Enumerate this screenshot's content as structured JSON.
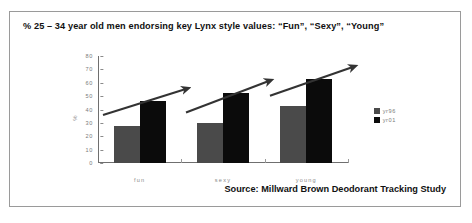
{
  "slide": {
    "title": "% 25 – 34 year old men endorsing key Lynx style values: “Fun”, “Sexy”, “Young”",
    "source": "Source: Millward Brown Deodorant Tracking Study"
  },
  "colors": {
    "series_yr96": "#4a4a4a",
    "series_yr01": "#0b0b0b",
    "axis": "#8a8a8a",
    "border": "#9a9a9a",
    "arrow": "#333333"
  },
  "chart_data": {
    "type": "bar",
    "title": "% 25 – 34 year old men endorsing key Lynx style values: “Fun”, “Sexy”, “Young”",
    "xlabel": "",
    "ylabel": "%",
    "categories": [
      "fun",
      "sexy",
      "young"
    ],
    "series": [
      {
        "name": "yr96",
        "values": [
          28,
          30,
          43
        ]
      },
      {
        "name": "yr01",
        "values": [
          46,
          52,
          63
        ]
      }
    ],
    "ylim": [
      0,
      80
    ],
    "yticks": [
      0,
      10,
      20,
      30,
      40,
      50,
      60,
      70,
      80
    ],
    "ytick_labels": [
      "0",
      "10",
      "20",
      "30",
      "40",
      "50",
      "60",
      "70",
      "80"
    ],
    "grid": false,
    "legend_position": "right",
    "annotations": [
      {
        "kind": "arrow",
        "over": "fun",
        "label": ""
      },
      {
        "kind": "arrow",
        "over": "sexy",
        "label": ""
      },
      {
        "kind": "arrow",
        "over": "young",
        "label": ""
      }
    ]
  }
}
